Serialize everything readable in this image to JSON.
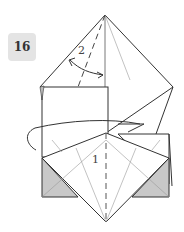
{
  "step": {
    "number": "16"
  },
  "labels": {
    "step1": "1",
    "step2": "2"
  },
  "colors": {
    "line": "#333333",
    "thin": "#999999",
    "shade": "#c8c8c8",
    "badge_bg": "#e4e4e4"
  },
  "icons": {
    "fold_arrow": "curved-arrow-icon",
    "swap_arrow": "double-arrow-icon"
  }
}
